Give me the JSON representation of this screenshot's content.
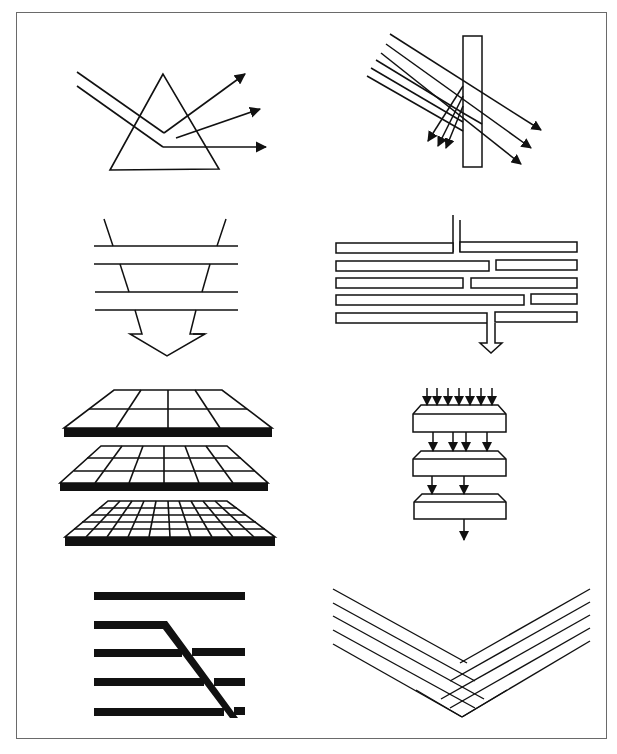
{
  "page": {
    "width": 617,
    "height": 754,
    "background": "#ffffff",
    "stroke_color": "#111111",
    "frame_color": "#6a6a6a",
    "frame": {
      "x": 16,
      "y": 12,
      "w": 591,
      "h": 727
    }
  },
  "panels": [
    {
      "id": "prism-dispersion",
      "row": 1,
      "col": 1,
      "description": "Triangular prism with two incoming parallel rays bending inside and three diverging output arrows",
      "triangle": [
        [
          163,
          74
        ],
        [
          110,
          170
        ],
        [
          219,
          169
        ]
      ],
      "rays_in": [
        [
          [
            77,
            72
          ],
          [
            164,
            133
          ],
          [
            176,
            137
          ]
        ],
        [
          [
            77,
            86
          ],
          [
            163,
            147
          ],
          [
            265,
            147
          ]
        ]
      ],
      "arrows_out": [
        [
          [
            164,
            133
          ],
          [
            245,
            73
          ]
        ],
        [
          [
            175,
            138
          ],
          [
            260,
            109
          ]
        ],
        [
          [
            163,
            147
          ],
          [
            266,
            147
          ]
        ]
      ]
    },
    {
      "id": "plate-beam-splitter",
      "row": 1,
      "col": 2,
      "description": "Vertical rectangular plate with six parallel diagonal rays; three pass through, three reflect back down-left",
      "plate": {
        "x": 463,
        "y": 36,
        "w": 19,
        "h": 131
      },
      "rays_through": [
        [
          [
            390,
            34
          ],
          [
            541,
            130
          ]
        ],
        [
          [
            386,
            44
          ],
          [
            531,
            148
          ]
        ],
        [
          [
            381,
            53
          ],
          [
            521,
            164
          ]
        ]
      ],
      "rays_reflected": [
        {
          "in": [
            [
              376,
              60
            ],
            [
              463,
              113
            ]
          ],
          "out": [
            [
              463,
              113
            ],
            [
              430,
              141
            ]
          ]
        },
        {
          "in": [
            [
              371,
              68
            ],
            [
              463,
              122
            ]
          ],
          "out": [
            [
              463,
              122
            ],
            [
              440,
              145
            ]
          ]
        },
        {
          "in": [
            [
              367,
              76
            ],
            [
              463,
              131
            ]
          ],
          "out": [
            [
              463,
              131
            ],
            [
              448,
              148
            ]
          ]
        }
      ]
    },
    {
      "id": "funnel-layers",
      "row": 2,
      "col": 1,
      "description": "Funnel outline crossing four horizontal lines, ending in a broad downward arrow",
      "horizontal_lines_y": [
        246,
        264,
        292,
        310
      ],
      "horizontal_lines_x": [
        94,
        238
      ],
      "left_edge": [
        [
          104,
          219
        ],
        [
          142,
          334
        ]
      ],
      "right_edge": [
        [
          226,
          219
        ],
        [
          197,
          334
        ]
      ],
      "arrowhead": [
        [
          130,
          334
        ],
        [
          142,
          334
        ],
        [
          142,
          334
        ],
        [
          167,
          356
        ],
        [
          205,
          334
        ],
        [
          197,
          334
        ]
      ]
    },
    {
      "id": "stacked-bars-channel",
      "row": 2,
      "col": 2,
      "description": "Five rows of horizontal bars with staggered gaps; a narrow channel enters top and exits bottom with an arrow",
      "bar_height": 10,
      "rows": [
        {
          "y": 242,
          "segments": [
            [
              336,
              453
            ],
            [
              460,
              577
            ]
          ]
        },
        {
          "y": 260,
          "segments": [
            [
              336,
              489
            ],
            [
              496,
              577
            ]
          ]
        },
        {
          "y": 278,
          "segments": [
            [
              336,
              463
            ],
            [
              471,
              577
            ]
          ]
        },
        {
          "y": 295,
          "segments": [
            [
              336,
              524
            ],
            [
              531,
              577
            ]
          ]
        },
        {
          "y": 313,
          "segments": [
            [
              336,
              487
            ],
            [
              495,
              577
            ]
          ]
        }
      ],
      "inlet_x": [
        453,
        460
      ],
      "inlet_top": 215,
      "outlet_x": [
        487,
        495
      ],
      "outlet_bottom": 340,
      "arrow_tip": [
        491,
        353
      ]
    },
    {
      "id": "layered-grids",
      "row": 3,
      "col": 1,
      "description": "Three perspective grid slabs stacked vertically with increasing resolution",
      "slabs": [
        {
          "top_y": 390,
          "bottom_y": 428,
          "top_x": [
            114,
            222
          ],
          "bottom_x": [
            64,
            272
          ],
          "thickness": 9,
          "cols": 4,
          "rows": 2
        },
        {
          "top_y": 446,
          "bottom_y": 483,
          "top_x": [
            101,
            227
          ],
          "bottom_x": [
            60,
            268
          ],
          "thickness": 8,
          "cols": 6,
          "rows": 3
        },
        {
          "top_y": 501,
          "bottom_y": 537,
          "top_x": [
            108,
            227
          ],
          "bottom_x": [
            65,
            275
          ],
          "thickness": 9,
          "cols": 10,
          "rows": 5
        }
      ]
    },
    {
      "id": "cascade-boxes",
      "row": 3,
      "col": 2,
      "description": "Three stacked beveled boxes with downward arrows converging: 7 in, 4 between first and second, 2 between second and third, 1 out",
      "boxes": [
        {
          "x": 413,
          "y": 405,
          "w": 93,
          "h": 27,
          "bevel": 8
        },
        {
          "x": 413,
          "y": 451,
          "w": 93,
          "h": 25,
          "bevel": 8
        },
        {
          "x": 414,
          "y": 494,
          "w": 92,
          "h": 25,
          "bevel": 8
        }
      ],
      "arrow_groups": [
        {
          "y1": 388,
          "y2": 406,
          "xs": [
            427,
            437,
            448,
            459,
            470,
            481,
            492
          ]
        },
        {
          "y1": 432,
          "y2": 452,
          "xs": [
            433,
            453,
            466,
            487
          ]
        },
        {
          "y1": 476,
          "y2": 494,
          "xs": [
            432,
            464
          ]
        },
        {
          "y1": 519,
          "y2": 540,
          "xs": [
            464
          ]
        }
      ]
    },
    {
      "id": "fault-offset",
      "row": 4,
      "col": 1,
      "description": "Five thick horizontal bands with a diagonal thick band cutting through the lower four",
      "bands_y": [
        596,
        626,
        652,
        682,
        712
      ],
      "band_x": [
        94,
        245
      ],
      "band_thickness": 8,
      "diagonal": [
        [
          166,
          624
        ],
        [
          238,
          718
        ]
      ],
      "diagonal_width": 8
    },
    {
      "id": "v-crosshatch",
      "row": 4,
      "col": 2,
      "description": "Five parallel lines from upper-left and five from upper-right meeting in a V to form a lattice",
      "left_lines": [
        [
          [
            333,
            589
          ],
          [
            467,
            663
          ]
        ],
        [
          [
            333,
            603
          ],
          [
            450,
            672
          ]
        ],
        [
          [
            333,
            616
          ],
          [
            436,
            683
          ]
        ],
        [
          [
            333,
            630
          ],
          [
            427,
            692
          ]
        ],
        [
          [
            333,
            644
          ],
          [
            416,
            702
          ]
        ]
      ],
      "right_lines": [
        [
          [
            590,
            589
          ],
          [
            461,
            663
          ]
        ],
        [
          [
            590,
            602
          ],
          [
            474,
            672
          ]
        ],
        [
          [
            590,
            615
          ],
          [
            484,
            683
          ]
        ],
        [
          [
            590,
            628
          ],
          [
            492,
            692
          ]
        ],
        [
          [
            590,
            641
          ],
          [
            507,
            702
          ]
        ]
      ],
      "apex": [
        462,
        717
      ]
    }
  ]
}
